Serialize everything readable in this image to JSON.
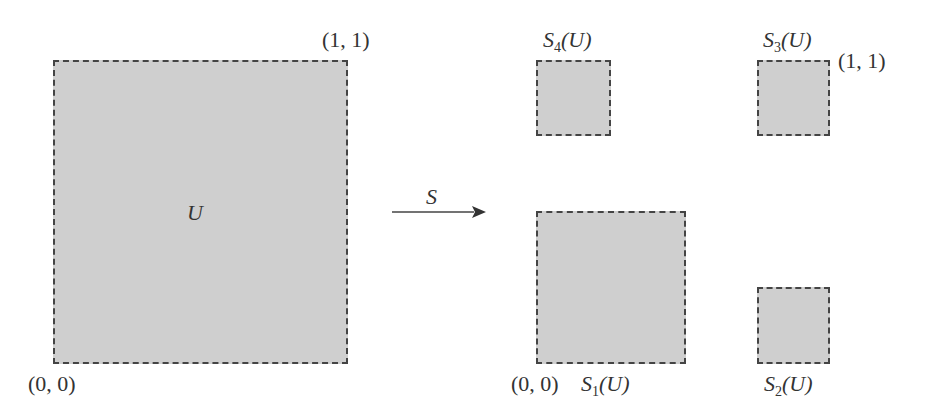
{
  "diagram": {
    "left": {
      "square_label": "U",
      "top_right_coord": "(1, 1)",
      "bottom_left_coord": "(0, 0)"
    },
    "arrow": {
      "label": "S"
    },
    "right": {
      "top_right_coord": "(1, 1)",
      "bottom_left_coord": "(0, 0)",
      "images": [
        {
          "name": "S",
          "sub": "1",
          "arg": "(U)"
        },
        {
          "name": "S",
          "sub": "2",
          "arg": "(U)"
        },
        {
          "name": "S",
          "sub": "3",
          "arg": "(U)"
        },
        {
          "name": "S",
          "sub": "4",
          "arg": "(U)"
        }
      ]
    },
    "colors": {
      "fill": "#cfcfcf",
      "border": "#444444"
    }
  }
}
